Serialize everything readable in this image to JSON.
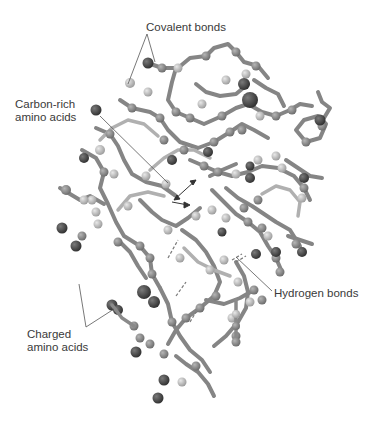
{
  "diagram": {
    "labels": {
      "covalent": "Covalent bonds",
      "carbon_line1": "Carbon-rich",
      "carbon_line2": "amino acids",
      "hydrogen": "Hydrogen bonds",
      "charged_line1": "Charged",
      "charged_line2": "amino acids"
    },
    "colors": {
      "background": "#ffffff",
      "label_text": "#3a3a3a",
      "leader_line": "#555555",
      "bond_stick": "#8c8c8c",
      "atom_light": "#c4c4c4",
      "atom_mid": "#8e8e8e",
      "atom_dark": "#4a4a4a"
    }
  }
}
